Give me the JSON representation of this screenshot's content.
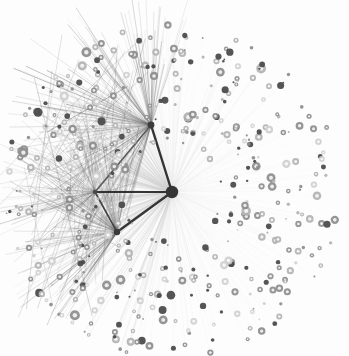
{
  "figure": {
    "title": "Network Graph",
    "type": "node-link-diagram",
    "width": 349,
    "height": 356,
    "background_color": "#fdfdfd"
  },
  "palette": {
    "background": "#fdfdfd",
    "hub_fill": "#3a3a3a",
    "node_dark": "#4a4a4a",
    "node_mid": "#8e8e8e",
    "node_light": "#b8b8b8",
    "node_faint": "#d2d2d2",
    "edge_faint": "#e6e6e6",
    "edge_light": "#d0d0d0",
    "edge_mid": "#9a9a9a",
    "edge_dark": "#4d4d4d",
    "edge_black": "#2a2a2a"
  },
  "chart_data": {
    "type": "scatter",
    "title": "Network Graph",
    "xlabel": "",
    "ylabel": "",
    "xlim": [
      0,
      349
    ],
    "ylim": [
      0,
      356
    ],
    "grid": false,
    "legend": "none",
    "layout": "radial force-directed",
    "center": [
      172,
      192
    ],
    "disc_radius": 168,
    "counts": {
      "hubs": 4,
      "peripheral_nodes": 470,
      "spoke_edges": 470,
      "bundle_edges": 210,
      "triangle_edges": 5
    },
    "hubs": [
      {
        "id": "H0",
        "label": "central-hub",
        "x": 172,
        "y": 192,
        "r": 6.2,
        "color": "#353535",
        "degree": 470
      },
      {
        "id": "H1",
        "label": "upper-left-hub",
        "x": 151,
        "y": 125,
        "r": 3.4,
        "color": "#3a3a3a",
        "degree": 150
      },
      {
        "id": "H2",
        "label": "lower-left-hub",
        "x": 117,
        "y": 232,
        "r": 3.2,
        "color": "#3a3a3a",
        "degree": 110
      },
      {
        "id": "H3",
        "label": "mid-left-hub",
        "x": 95,
        "y": 192,
        "r": 2.2,
        "color": "#4a4a4a",
        "degree": 80
      }
    ],
    "triangle_edges": [
      {
        "from": "H0",
        "to": "H1",
        "width": 2.4,
        "color": "#2a2a2a"
      },
      {
        "from": "H0",
        "to": "H2",
        "width": 2.2,
        "color": "#2a2a2a"
      },
      {
        "from": "H0",
        "to": "H3",
        "width": 2.0,
        "color": "#2a2a2a"
      },
      {
        "from": "H1",
        "to": "H3",
        "width": 1.5,
        "color": "#555555"
      },
      {
        "from": "H2",
        "to": "H3",
        "width": 1.6,
        "color": "#3d3d3d"
      }
    ],
    "node_size_classes": [
      {
        "name": "tiny",
        "r": 1.0,
        "share": 0.16
      },
      {
        "name": "small",
        "r": 1.8,
        "share": 0.3
      },
      {
        "name": "medium",
        "r": 2.6,
        "share": 0.3
      },
      {
        "name": "large",
        "r": 3.4,
        "share": 0.17
      },
      {
        "name": "xlarge",
        "r": 4.2,
        "share": 0.07
      }
    ],
    "node_shade_classes": [
      {
        "name": "dark-filled",
        "color": "#4a4a4a",
        "share": 0.22
      },
      {
        "name": "mid-ring",
        "color": "#8e8e8e",
        "share": 0.36
      },
      {
        "name": "light-ring",
        "color": "#b4b4b4",
        "share": 0.28
      },
      {
        "name": "faint-ring",
        "color": "#d0d0d0",
        "share": 0.14
      }
    ],
    "density_note": "Edge density and darkness increase toward the left quadrant (between bearings 110 and 250 degrees) where the three secondary hubs create overlapping dark bundles; the right half shows only pale single spokes."
  }
}
